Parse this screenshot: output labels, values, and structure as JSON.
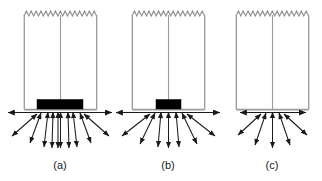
{
  "figure": {
    "width": 322,
    "height": 181,
    "background_color": "#ffffff",
    "type": "technical-line-diagram",
    "colors": {
      "outline": "#9a9a9a",
      "arrow": "#1a1a1a",
      "arrow_light": "#6f6f6f",
      "block_fill": "#000000",
      "label_text": "#1a1a1a",
      "background": "#ffffff"
    },
    "panels": [
      {
        "id": "a",
        "label": "(a)",
        "label_x": 60,
        "label_y": 169,
        "frame": {
          "x": 24,
          "y": 14,
          "width": 73,
          "height": 95
        },
        "zigzag": {
          "teeth": 15,
          "amplitude": 4,
          "y": 14
        },
        "center_line": {
          "x": 60,
          "y_top": 14,
          "y_bottom": 109
        },
        "block": {
          "present": true,
          "x": 37,
          "y": 100,
          "width": 46,
          "height": 9,
          "size": "wide"
        },
        "baseline_y": 110,
        "horizontal_arrow": {
          "x_left": 4,
          "x_right": 116,
          "y": 112,
          "double_headed": true
        },
        "converging_point": {
          "x": 60,
          "y": 112
        },
        "converging_arrows": 9,
        "arrow_style": "double-headed"
      },
      {
        "id": "b",
        "label": "(b)",
        "label_x": 168,
        "label_y": 169,
        "frame": {
          "x": 132,
          "y": 14,
          "width": 73,
          "height": 95
        },
        "zigzag": {
          "teeth": 15,
          "amplitude": 4,
          "y": 14
        },
        "center_line": {
          "x": 168,
          "y_top": 14,
          "y_bottom": 109
        },
        "block": {
          "present": true,
          "x": 156,
          "y": 100,
          "width": 25,
          "height": 9,
          "size": "narrow"
        },
        "baseline_y": 110,
        "horizontal_arrow": {
          "x_left": 112,
          "x_right": 224,
          "y": 112,
          "double_headed": true
        },
        "converging_point": {
          "x": 168,
          "y": 112
        },
        "converging_arrows": 7,
        "arrow_style": "double-headed"
      },
      {
        "id": "c",
        "label": "(c)",
        "label_x": 272,
        "label_y": 169,
        "frame": {
          "x": 236,
          "y": 14,
          "width": 73,
          "height": 95
        },
        "zigzag": {
          "teeth": 15,
          "amplitude": 4,
          "y": 14
        },
        "center_line": {
          "x": 272,
          "y_top": 14,
          "y_bottom": 109
        },
        "block": {
          "present": false,
          "size": "none"
        },
        "baseline_y": 110,
        "horizontal_arrow": {
          "x_left": 232,
          "x_right": 312,
          "y": 112,
          "double_headed": true
        },
        "converging_point": {
          "x": 272,
          "y": 112
        },
        "converging_arrows": 5,
        "arrow_style": "double-headed"
      }
    ]
  }
}
